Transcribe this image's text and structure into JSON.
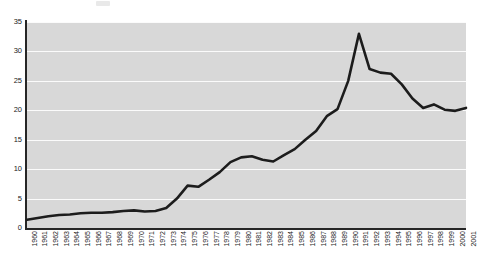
{
  "chart_data": {
    "type": "line",
    "title": "",
    "subtitle": "",
    "xlabel": "",
    "ylabel": "",
    "grid": "horizontal",
    "legend": "none",
    "ylim": [
      0,
      35
    ],
    "yticks": [
      "0",
      "5",
      "10",
      "15",
      "20",
      "25",
      "30",
      "35"
    ],
    "ytick_values": [
      0,
      5,
      10,
      15,
      20,
      25,
      30,
      35
    ],
    "xlim": [
      "1960",
      "2001"
    ],
    "categories": [
      "1960",
      "1961",
      "1962",
      "1963",
      "1964",
      "1965",
      "1966",
      "1967",
      "1968",
      "1969",
      "1970",
      "1971",
      "1972",
      "1973",
      "1974",
      "1975",
      "1976",
      "1977",
      "1978",
      "1979",
      "1980",
      "1981",
      "1982",
      "1983",
      "1984",
      "1985",
      "1986",
      "1987",
      "1988",
      "1989",
      "1990",
      "1991",
      "1992",
      "1993",
      "1994",
      "1995",
      "1996",
      "1997",
      "1998",
      "1999",
      "2000",
      "2001"
    ],
    "series": [
      {
        "name": "",
        "values": [
          1.4,
          1.7,
          2.0,
          2.2,
          2.3,
          2.5,
          2.6,
          2.6,
          2.7,
          2.9,
          3.0,
          2.8,
          2.9,
          3.4,
          5.0,
          7.2,
          7.0,
          8.2,
          9.5,
          11.2,
          12.0,
          12.2,
          11.6,
          11.3,
          12.4,
          13.4,
          15.0,
          16.5,
          19.0,
          20.2,
          25.0,
          33.0,
          27.0,
          26.4,
          26.2,
          24.4,
          22.0,
          20.4,
          21.0,
          20.1,
          19.9,
          20.4
        ]
      }
    ]
  },
  "axis": {
    "y_tick_labels": [
      "35",
      "30",
      "25",
      "20",
      "15",
      "10",
      "5",
      "0"
    ]
  }
}
